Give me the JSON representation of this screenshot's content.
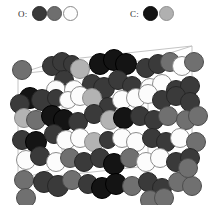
{
  "legend": {
    "oxygen": {
      "label": "O:",
      "swatches": [
        {
          "name": "o-dark",
          "fill": "#3a3a3a",
          "stroke": "#2a2a2a"
        },
        {
          "name": "o-gray",
          "fill": "#6e6e6e",
          "stroke": "#555555"
        },
        {
          "name": "o-white",
          "fill": "#fdfdfd",
          "stroke": "#8a8a8a"
        }
      ]
    },
    "carbon": {
      "label": "C:",
      "swatches": [
        {
          "name": "c-black",
          "fill": "#141414",
          "stroke": "#0a0a0a"
        },
        {
          "name": "c-gray",
          "fill": "#b0b0b0",
          "stroke": "#909090"
        }
      ]
    }
  },
  "axes": {
    "a": "a",
    "b": "b",
    "c": "c"
  },
  "cell": {
    "line_color": "#bdbdbd",
    "front": [
      [
        18,
        152
      ],
      [
        18,
        46
      ],
      [
        148,
        32
      ],
      [
        148,
        138
      ]
    ],
    "back": [
      [
        62,
        138
      ],
      [
        62,
        32
      ],
      [
        192,
        18
      ],
      [
        192,
        124
      ]
    ]
  },
  "palette": {
    "o_dark": {
      "fill": "#3a3a3a",
      "stroke": "#262626"
    },
    "o_gray": {
      "fill": "#707070",
      "stroke": "#4d4d4d"
    },
    "o_white": {
      "fill": "#fcfcfc",
      "stroke": "#8d8d8d"
    },
    "c_black": {
      "fill": "#141414",
      "stroke": "#000000"
    },
    "c_gray": {
      "fill": "#b3b3b3",
      "stroke": "#8c8c8c"
    }
  },
  "atoms": [
    {
      "x": 22,
      "y": 42,
      "r": 10,
      "t": "o_gray"
    },
    {
      "x": 52,
      "y": 38,
      "r": 10,
      "t": "o_dark"
    },
    {
      "x": 62,
      "y": 34,
      "r": 10,
      "t": "o_dark"
    },
    {
      "x": 72,
      "y": 36,
      "r": 9,
      "t": "o_dark"
    },
    {
      "x": 80,
      "y": 41,
      "r": 10,
      "t": "c_gray"
    },
    {
      "x": 100,
      "y": 36,
      "r": 11,
      "t": "c_black"
    },
    {
      "x": 114,
      "y": 32,
      "r": 11,
      "t": "c_black"
    },
    {
      "x": 126,
      "y": 36,
      "r": 11,
      "t": "c_black"
    },
    {
      "x": 146,
      "y": 40,
      "r": 10,
      "t": "o_dark"
    },
    {
      "x": 158,
      "y": 36,
      "r": 10,
      "t": "o_dark"
    },
    {
      "x": 170,
      "y": 34,
      "r": 10,
      "t": "o_gray"
    },
    {
      "x": 182,
      "y": 38,
      "r": 10,
      "t": "o_white"
    },
    {
      "x": 194,
      "y": 34,
      "r": 10,
      "t": "o_gray"
    },
    {
      "x": 64,
      "y": 52,
      "r": 10,
      "t": "o_dark"
    },
    {
      "x": 56,
      "y": 62,
      "r": 10,
      "t": "o_white"
    },
    {
      "x": 74,
      "y": 62,
      "r": 10,
      "t": "o_white"
    },
    {
      "x": 92,
      "y": 56,
      "r": 10,
      "t": "o_dark"
    },
    {
      "x": 104,
      "y": 60,
      "r": 11,
      "t": "o_dark"
    },
    {
      "x": 118,
      "y": 52,
      "r": 10,
      "t": "o_dark"
    },
    {
      "x": 132,
      "y": 58,
      "r": 10,
      "t": "o_dark"
    },
    {
      "x": 150,
      "y": 60,
      "r": 10,
      "t": "o_white"
    },
    {
      "x": 162,
      "y": 56,
      "r": 10,
      "t": "o_white"
    },
    {
      "x": 176,
      "y": 62,
      "r": 10,
      "t": "o_dark"
    },
    {
      "x": 190,
      "y": 58,
      "r": 10,
      "t": "o_dark"
    },
    {
      "x": 30,
      "y": 70,
      "r": 11,
      "t": "c_black"
    },
    {
      "x": 42,
      "y": 72,
      "r": 11,
      "t": "o_dark"
    },
    {
      "x": 20,
      "y": 76,
      "r": 10,
      "t": "o_dark"
    },
    {
      "x": 56,
      "y": 70,
      "r": 9,
      "t": "o_dark"
    },
    {
      "x": 68,
      "y": 72,
      "r": 9,
      "t": "o_white"
    },
    {
      "x": 80,
      "y": 68,
      "r": 10,
      "t": "o_white"
    },
    {
      "x": 92,
      "y": 70,
      "r": 10,
      "t": "c_gray"
    },
    {
      "x": 108,
      "y": 78,
      "r": 9,
      "t": "o_dark"
    },
    {
      "x": 122,
      "y": 72,
      "r": 10,
      "t": "o_white"
    },
    {
      "x": 136,
      "y": 70,
      "r": 10,
      "t": "o_white"
    },
    {
      "x": 148,
      "y": 66,
      "r": 10,
      "t": "o_white"
    },
    {
      "x": 162,
      "y": 72,
      "r": 10,
      "t": "o_dark"
    },
    {
      "x": 176,
      "y": 68,
      "r": 10,
      "t": "o_dark"
    },
    {
      "x": 190,
      "y": 74,
      "r": 10,
      "t": "o_dark"
    },
    {
      "x": 24,
      "y": 90,
      "r": 10,
      "t": "c_gray"
    },
    {
      "x": 36,
      "y": 92,
      "r": 10,
      "t": "o_gray"
    },
    {
      "x": 52,
      "y": 88,
      "r": 11,
      "t": "c_black"
    },
    {
      "x": 64,
      "y": 92,
      "r": 11,
      "t": "c_black"
    },
    {
      "x": 78,
      "y": 94,
      "r": 10,
      "t": "o_dark"
    },
    {
      "x": 94,
      "y": 86,
      "r": 10,
      "t": "o_dark"
    },
    {
      "x": 110,
      "y": 92,
      "r": 10,
      "t": "c_gray"
    },
    {
      "x": 124,
      "y": 90,
      "r": 11,
      "t": "c_black"
    },
    {
      "x": 140,
      "y": 88,
      "r": 10,
      "t": "o_dark"
    },
    {
      "x": 154,
      "y": 92,
      "r": 10,
      "t": "o_dark"
    },
    {
      "x": 168,
      "y": 88,
      "r": 10,
      "t": "o_gray"
    },
    {
      "x": 186,
      "y": 92,
      "r": 10,
      "t": "o_gray"
    },
    {
      "x": 198,
      "y": 88,
      "r": 10,
      "t": "o_gray"
    },
    {
      "x": 22,
      "y": 112,
      "r": 10,
      "t": "o_dark"
    },
    {
      "x": 36,
      "y": 114,
      "r": 11,
      "t": "c_black"
    },
    {
      "x": 54,
      "y": 106,
      "r": 10,
      "t": "o_dark"
    },
    {
      "x": 66,
      "y": 112,
      "r": 10,
      "t": "o_white"
    },
    {
      "x": 80,
      "y": 110,
      "r": 10,
      "t": "o_white"
    },
    {
      "x": 94,
      "y": 114,
      "r": 10,
      "t": "c_gray"
    },
    {
      "x": 108,
      "y": 112,
      "r": 9,
      "t": "o_dark"
    },
    {
      "x": 122,
      "y": 110,
      "r": 10,
      "t": "o_white"
    },
    {
      "x": 136,
      "y": 114,
      "r": 10,
      "t": "o_white"
    },
    {
      "x": 152,
      "y": 110,
      "r": 10,
      "t": "o_dark"
    },
    {
      "x": 166,
      "y": 114,
      "r": 10,
      "t": "o_dark"
    },
    {
      "x": 180,
      "y": 110,
      "r": 10,
      "t": "o_white"
    },
    {
      "x": 196,
      "y": 114,
      "r": 10,
      "t": "o_gray"
    },
    {
      "x": 26,
      "y": 132,
      "r": 10,
      "t": "o_white"
    },
    {
      "x": 40,
      "y": 128,
      "r": 10,
      "t": "o_dark"
    },
    {
      "x": 56,
      "y": 134,
      "r": 10,
      "t": "o_white"
    },
    {
      "x": 70,
      "y": 130,
      "r": 10,
      "t": "o_gray"
    },
    {
      "x": 84,
      "y": 134,
      "r": 10,
      "t": "o_dark"
    },
    {
      "x": 100,
      "y": 130,
      "r": 10,
      "t": "o_dark"
    },
    {
      "x": 114,
      "y": 136,
      "r": 11,
      "t": "c_black"
    },
    {
      "x": 130,
      "y": 130,
      "r": 10,
      "t": "o_gray"
    },
    {
      "x": 146,
      "y": 134,
      "r": 10,
      "t": "o_white"
    },
    {
      "x": 160,
      "y": 130,
      "r": 10,
      "t": "o_white"
    },
    {
      "x": 176,
      "y": 134,
      "r": 10,
      "t": "o_dark"
    },
    {
      "x": 190,
      "y": 130,
      "r": 10,
      "t": "o_dark"
    },
    {
      "x": 24,
      "y": 152,
      "r": 10,
      "t": "o_gray"
    },
    {
      "x": 44,
      "y": 154,
      "r": 11,
      "t": "o_dark"
    },
    {
      "x": 58,
      "y": 158,
      "r": 11,
      "t": "o_dark"
    },
    {
      "x": 72,
      "y": 152,
      "r": 10,
      "t": "o_gray"
    },
    {
      "x": 88,
      "y": 156,
      "r": 10,
      "t": "o_dark"
    },
    {
      "x": 102,
      "y": 160,
      "r": 11,
      "t": "c_black"
    },
    {
      "x": 116,
      "y": 156,
      "r": 11,
      "t": "c_black"
    },
    {
      "x": 132,
      "y": 158,
      "r": 10,
      "t": "o_gray"
    },
    {
      "x": 148,
      "y": 154,
      "r": 10,
      "t": "o_dark"
    },
    {
      "x": 162,
      "y": 160,
      "r": 10,
      "t": "o_dark"
    },
    {
      "x": 178,
      "y": 154,
      "r": 10,
      "t": "o_gray"
    },
    {
      "x": 192,
      "y": 158,
      "r": 10,
      "t": "o_gray"
    },
    {
      "x": 26,
      "y": 170,
      "r": 10,
      "t": "o_gray"
    },
    {
      "x": 150,
      "y": 172,
      "r": 10,
      "t": "o_gray"
    },
    {
      "x": 164,
      "y": 170,
      "r": 10,
      "t": "o_gray"
    },
    {
      "x": 188,
      "y": 140,
      "r": 10,
      "t": "o_gray"
    }
  ]
}
